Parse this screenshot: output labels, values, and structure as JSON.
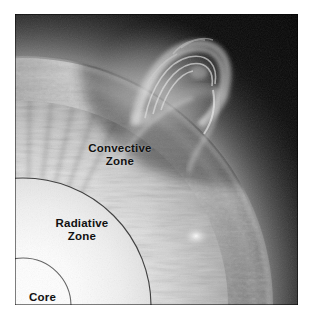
{
  "figure": {
    "kind": "solar-interior-cutaway-photograph",
    "plate": {
      "left": 15,
      "top": 14,
      "width": 283,
      "height": 291,
      "background_color": "#ffffff",
      "space_color": "#060606"
    }
  },
  "labels": {
    "convective": {
      "line1": "Convective",
      "line2": "Zone",
      "color": "#111111"
    },
    "radiative": {
      "line1": "Radiative",
      "line2": "Zone",
      "color": "#111111"
    },
    "core": {
      "line1": "Core",
      "color": "#111111"
    }
  },
  "boundaries": [
    {
      "name": "convective-radiative-boundary-arc",
      "stroke": "#2a2a2a",
      "note": "Outer thin arc separating the Radiative Zone from the Convective Zone"
    },
    {
      "name": "core-boundary-arc",
      "stroke": "#4a4a4a",
      "note": "Inner thin arc bounding the Core"
    }
  ],
  "features": [
    {
      "name": "prominence-loop",
      "note": "Arching erupting prominence at upper area of the limb"
    },
    {
      "name": "solar-limb-band",
      "note": "Bright granular curved band forming the visible edge of the Sun"
    },
    {
      "name": "convection-striations",
      "note": "Radial streaky cells in the convective zone"
    },
    {
      "name": "core-glow",
      "note": "Brightest near-white glow at lower-left interior"
    },
    {
      "name": "flare-bright-spot",
      "note": "Small bright knot on the limb at lower right"
    },
    {
      "name": "space-background",
      "note": "Near-black sky outside the limb"
    }
  ],
  "palette": {
    "core_white": "#fbfbfb",
    "radiative_light": "#d9d9d9",
    "convective_mid": "#8a8a8a",
    "limb_bright": "#c9c9c9",
    "space_black": "#060606",
    "label_black": "#111111"
  }
}
